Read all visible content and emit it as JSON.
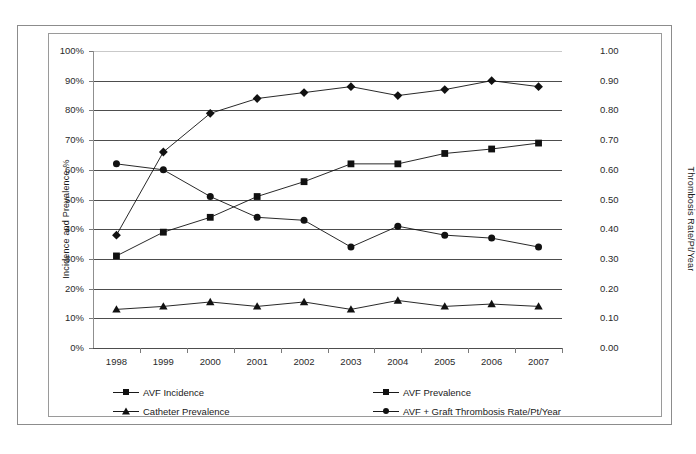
{
  "chart_data": {
    "type": "line",
    "title": "",
    "xlabel": "",
    "ylabel": "Incidence and Prevalence %",
    "y2label": "Thrombosis Rate/Pt/Year",
    "categories": [
      "1998",
      "1999",
      "2000",
      "2001",
      "2002",
      "2003",
      "2004",
      "2005",
      "2006",
      "2007"
    ],
    "ylim": [
      0,
      100
    ],
    "y2lim": [
      0.0,
      1.0
    ],
    "yticks": [
      "0%",
      "10%",
      "20%",
      "30%",
      "40%",
      "50%",
      "60%",
      "70%",
      "80%",
      "90%",
      "100%"
    ],
    "y2ticks": [
      "0.00",
      "0.10",
      "0.20",
      "0.30",
      "0.40",
      "0.50",
      "0.60",
      "0.70",
      "0.80",
      "0.90",
      "1.00"
    ],
    "grid": true,
    "legend_position": "bottom",
    "series": [
      {
        "name": "AVF Incidence",
        "axis": "left",
        "marker": "diamond",
        "unit": "%",
        "values": [
          38,
          66,
          79,
          84,
          86,
          88,
          85,
          87,
          90,
          88
        ]
      },
      {
        "name": "AVF Prevalence",
        "axis": "left",
        "marker": "square",
        "unit": "%",
        "values": [
          31,
          39,
          44,
          51,
          56,
          62,
          62,
          65.5,
          67,
          69
        ]
      },
      {
        "name": "Catheter Prevalence",
        "axis": "left",
        "marker": "triangle",
        "unit": "%",
        "values": [
          13,
          14,
          15.5,
          14,
          15.5,
          13,
          16,
          14,
          14.8,
          14
        ]
      },
      {
        "name": "AVF + Graft Thrombosis Rate/Pt/Year",
        "axis": "right",
        "marker": "circle",
        "unit": "rate",
        "values": [
          0.62,
          0.6,
          0.51,
          0.44,
          0.43,
          0.34,
          0.41,
          0.38,
          0.37,
          0.34
        ]
      }
    ]
  },
  "axes": {
    "left_title": "Incidence and Prevalence %",
    "right_title": "Thrombosis Rate/Pt/Year"
  },
  "legend": {
    "items": [
      {
        "label": "AVF Incidence",
        "marker": "diamond-marker"
      },
      {
        "label": "AVF Prevalence",
        "marker": "square-marker"
      },
      {
        "label": "Catheter Prevalence",
        "marker": "triangle-marker"
      },
      {
        "label": "AVF + Graft Thrombosis Rate/Pt/Year",
        "marker": "circle-marker"
      }
    ]
  },
  "colors": {
    "series": "#111111",
    "grid": "#4d4d4d",
    "frame": "#8c8c8c",
    "text": "#1a1a1a",
    "background": "#ffffff"
  }
}
